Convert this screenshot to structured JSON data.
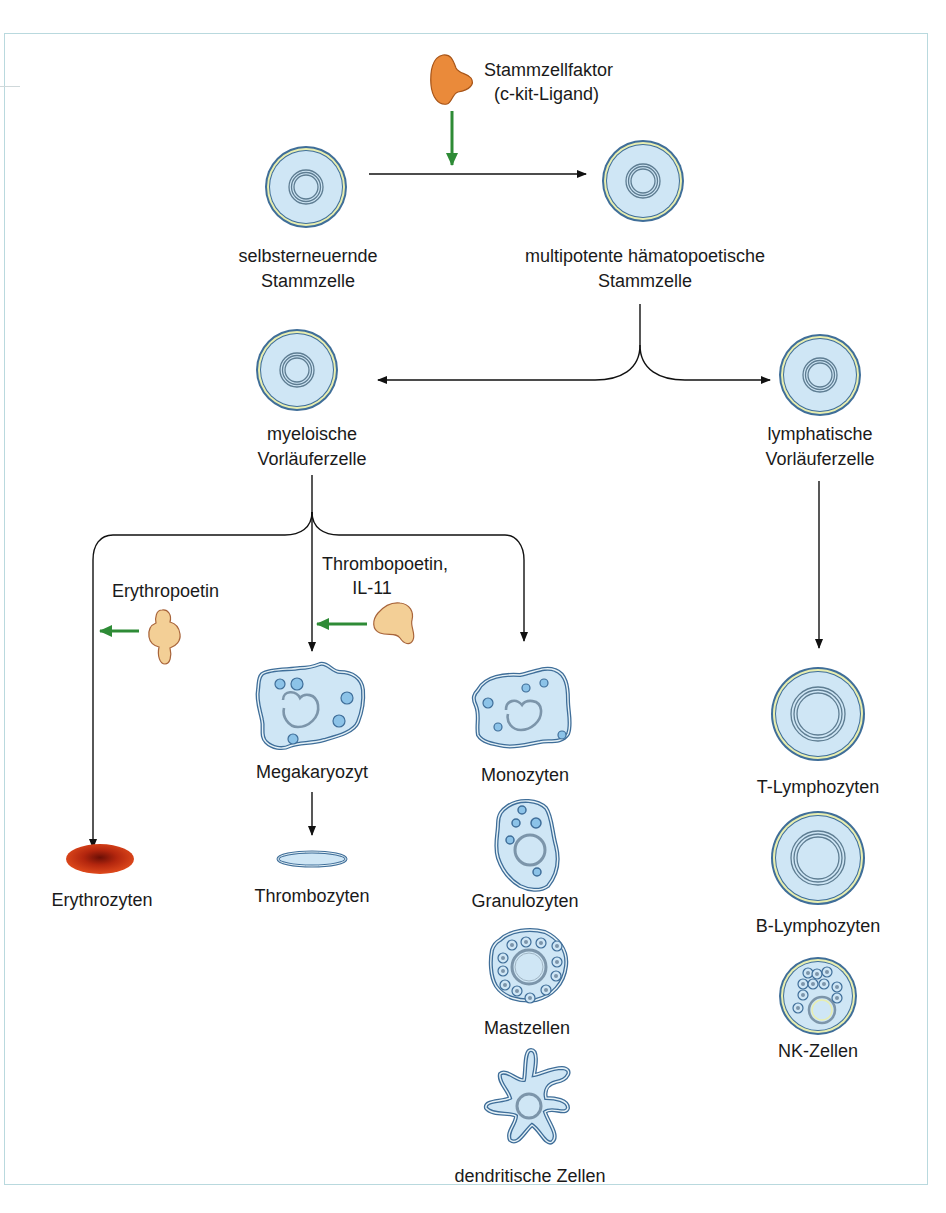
{
  "colors": {
    "cell_fill": "#cfe6f5",
    "cell_border": "#3f6e99",
    "cell_ring": "#e8eeb0",
    "growth_factor_orange": "#ea8a3a",
    "growth_factor_tan": "#f3cf96",
    "signal_arrow": "#2e8b36",
    "erythrocyte": "#c63212",
    "frame": "#b9d9de"
  },
  "factors": {
    "stem_cell_factor": {
      "line1": "Stammzellfaktor",
      "line2": "(c-kit-Ligand)",
      "icon": "growth-factor-orange"
    },
    "erythropoetin": {
      "label": "Erythropoetin",
      "icon": "growth-factor-tan"
    },
    "thrombopoetin": {
      "line1": "Thrombopoetin,",
      "line2": "IL-11",
      "icon": "growth-factor-tan"
    }
  },
  "cells": {
    "self_renewing": {
      "line1": "selbsterneuernde",
      "line2": "Stammzelle"
    },
    "multipotent": {
      "line1": "multipotente hämatopoetische",
      "line2": "Stammzelle"
    },
    "myeloid_progenitor": {
      "line1": "myeloische",
      "line2": "Vorläuferzelle"
    },
    "lymphoid_progenitor": {
      "line1": "lymphatische",
      "line2": "Vorläuferzelle"
    },
    "megakaryocyte": {
      "label": "Megakaryozyt"
    },
    "thrombocytes": {
      "label": "Thrombozyten"
    },
    "erythrocytes": {
      "label": "Erythrozyten"
    },
    "monocytes": {
      "label": "Monozyten"
    },
    "granulocytes": {
      "label": "Granulozyten"
    },
    "mast_cells": {
      "label": "Mastzellen"
    },
    "dendritic_cells": {
      "label": "dendritische Zellen"
    },
    "t_lymphocytes": {
      "label": "T-Lymphozyten"
    },
    "b_lymphocytes": {
      "label": "B-Lymphozyten"
    },
    "nk_cells": {
      "label": "NK-Zellen"
    }
  },
  "edges": [
    {
      "from": "selbsterneuernde Stammzelle",
      "to": "multipotente hämatopoetische Stammzelle",
      "modulator": "Stammzellfaktor"
    },
    {
      "from": "multipotente hämatopoetische Stammzelle",
      "to": "myeloische Vorläuferzelle"
    },
    {
      "from": "multipotente hämatopoetische Stammzelle",
      "to": "lymphatische Vorläuferzelle"
    },
    {
      "from": "myeloische Vorläuferzelle",
      "to": "Erythrozyten",
      "modulator": "Erythropoetin"
    },
    {
      "from": "myeloische Vorläuferzelle",
      "to": "Megakaryozyt",
      "modulator": "Thrombopoetin, IL-11"
    },
    {
      "from": "myeloische Vorläuferzelle",
      "to": "Monozyten / Granulozyten / Mastzellen / dendritische Zellen"
    },
    {
      "from": "Megakaryozyt",
      "to": "Thrombozyten"
    },
    {
      "from": "lymphatische Vorläuferzelle",
      "to": "T-Lymphozyten / B-Lymphozyten / NK-Zellen"
    }
  ]
}
